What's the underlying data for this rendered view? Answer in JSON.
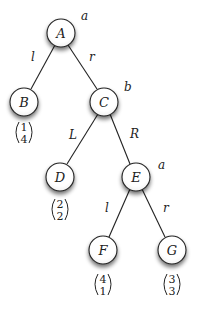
{
  "diagram": {
    "type": "game-tree",
    "nodes": [
      {
        "id": "A",
        "label": "A",
        "x": 61,
        "y": 33,
        "player": "a"
      },
      {
        "id": "B",
        "label": "B",
        "x": 24,
        "y": 102,
        "payoff": [
          "1",
          "4"
        ]
      },
      {
        "id": "C",
        "label": "C",
        "x": 104,
        "y": 102,
        "player": "b"
      },
      {
        "id": "D",
        "label": "D",
        "x": 60,
        "y": 177,
        "payoff": [
          "2",
          "2"
        ]
      },
      {
        "id": "E",
        "label": "E",
        "x": 136,
        "y": 177,
        "player": "a"
      },
      {
        "id": "F",
        "label": "F",
        "x": 103,
        "y": 250,
        "payoff": [
          "4",
          "1"
        ]
      },
      {
        "id": "G",
        "label": "G",
        "x": 172,
        "y": 250,
        "payoff": [
          "3",
          "3"
        ]
      }
    ],
    "edges": [
      {
        "from": "A",
        "to": "B",
        "label": "l"
      },
      {
        "from": "A",
        "to": "C",
        "label": "r"
      },
      {
        "from": "C",
        "to": "D",
        "label": "L"
      },
      {
        "from": "C",
        "to": "E",
        "label": "R"
      },
      {
        "from": "E",
        "to": "F",
        "label": "l"
      },
      {
        "from": "E",
        "to": "G",
        "label": "r"
      }
    ],
    "player_labels": {
      "A": "a",
      "C": "b",
      "E": "a"
    }
  }
}
